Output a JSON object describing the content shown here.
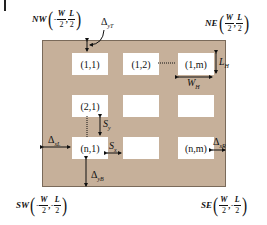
{
  "diagram": {
    "type": "array layout schematic",
    "colors": {
      "substrate": "#c6b09a",
      "cell": "#ffffff",
      "annotation": "#111111"
    },
    "corners": {
      "nw": {
        "label": "NW",
        "x_sign": "-",
        "x_num": "W",
        "x_den": "2",
        "sep": ",",
        "y_sign": "",
        "y_num": "L",
        "y_den": "2"
      },
      "ne": {
        "label": "NE",
        "x_sign": "",
        "x_num": "W",
        "x_den": "2",
        "sep": ",",
        "y_sign": "",
        "y_num": "L",
        "y_den": "2"
      },
      "sw": {
        "label": "SW",
        "x_sign": "-",
        "x_num": "W",
        "x_den": "2",
        "sep": ",",
        "y_sign": "-",
        "y_num": "L",
        "y_den": "2"
      },
      "se": {
        "label": "SE",
        "x_sign": "",
        "x_num": "W",
        "x_den": "2",
        "sep": ",",
        "y_sign": "-",
        "y_num": "L",
        "y_den": "2"
      }
    },
    "cells": [
      {
        "label": "(1,1)"
      },
      {
        "label": "(1,2)"
      },
      {
        "label": "(1,m)"
      },
      {
        "label": "(2,1)"
      },
      {
        "label": ""
      },
      {
        "label": ""
      },
      {
        "label": "(n,1)"
      },
      {
        "label": ""
      },
      {
        "label": "(n,m)"
      }
    ],
    "dimensions": {
      "delta_top": {
        "symbol": "Δ",
        "sub": "yT"
      },
      "delta_bottom": {
        "symbol": "Δ",
        "sub": "yB"
      },
      "delta_left": {
        "symbol": "Δ",
        "sub": "xL"
      },
      "delta_right": {
        "symbol": "Δ",
        "sub": "xR"
      },
      "cell_height": {
        "symbol": "L",
        "sub": "H"
      },
      "cell_width": {
        "symbol": "W",
        "sub": "H"
      },
      "spacing_y": {
        "symbol": "S",
        "sub": "y"
      },
      "spacing_x": {
        "symbol": "S",
        "sub": "x"
      }
    }
  }
}
